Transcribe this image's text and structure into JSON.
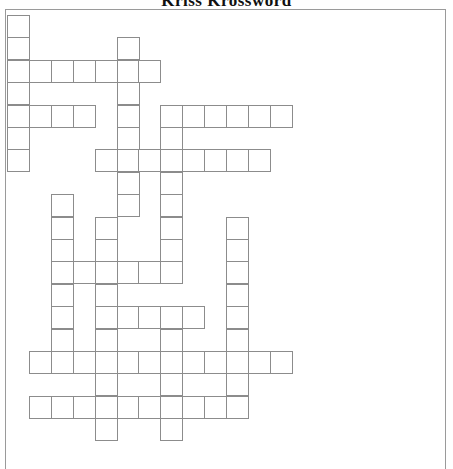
{
  "puzzle": {
    "title": "Kriss Krossword",
    "grid": {
      "origin_x": 7,
      "origin_y": 15,
      "cell_w": 21.9,
      "cell_h": 22.4,
      "cols": 13,
      "rows": 19
    },
    "words": [
      {
        "dir": "down",
        "row": 0,
        "col": 0,
        "length": 7
      },
      {
        "dir": "across",
        "row": 2,
        "col": 0,
        "length": 7
      },
      {
        "dir": "down",
        "row": 1,
        "col": 5,
        "length": 8
      },
      {
        "dir": "across",
        "row": 4,
        "col": 0,
        "length": 4
      },
      {
        "dir": "across",
        "row": 4,
        "col": 7,
        "length": 6
      },
      {
        "dir": "across",
        "row": 6,
        "col": 4,
        "length": 8
      },
      {
        "dir": "down",
        "row": 4,
        "col": 7,
        "length": 8
      },
      {
        "dir": "across",
        "row": 11,
        "col": 2,
        "length": 6
      },
      {
        "dir": "down",
        "row": 8,
        "col": 2,
        "length": 8
      },
      {
        "dir": "down",
        "row": 9,
        "col": 4,
        "length": 10
      },
      {
        "dir": "across",
        "row": 13,
        "col": 4,
        "length": 5
      },
      {
        "dir": "down",
        "row": 13,
        "col": 7,
        "length": 6
      },
      {
        "dir": "across",
        "row": 15,
        "col": 1,
        "length": 12
      },
      {
        "dir": "across",
        "row": 17,
        "col": 1,
        "length": 10
      },
      {
        "dir": "down",
        "row": 9,
        "col": 10,
        "length": 9
      }
    ]
  }
}
